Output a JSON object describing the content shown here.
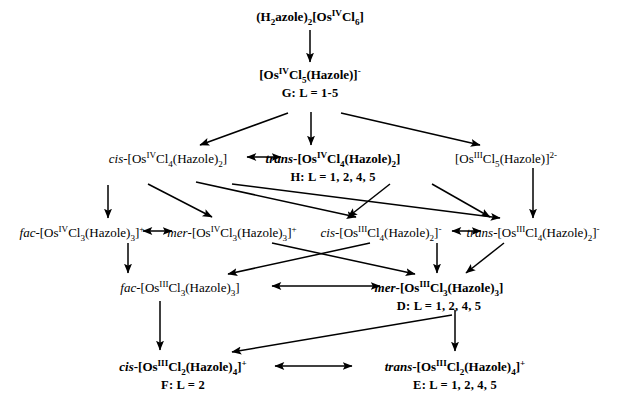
{
  "diagram": {
    "nodes": [
      {
        "id": "start",
        "formula_html": "(H<sub>2</sub>azole)<sub>2</sub>[Os<sup>IV</sup>Cl<sub>6</sub>]",
        "formula_text": "(H2azole)2[OsIVCl6]",
        "label": "",
        "x": 310,
        "y": 10,
        "bold": true
      },
      {
        "id": "G",
        "formula_html": "[Os<sup>IV</sup>Cl<sub>5</sub>(Hazole)]<sup>-</sup>",
        "formula_text": "[OsIVCl5(Hazole)]-",
        "label": "G: L = 1-5",
        "x": 310,
        "y": 68,
        "bold": true
      },
      {
        "id": "cis-Os4-Cl4",
        "formula_html": "<span class=\"ital-reg\">cis</span>-[Os<sup>IV</sup>Cl<sub>4</sub>(Hazole)<sub>2</sub>]",
        "formula_text": "cis-[OsIVCl4(Hazole)2]",
        "label": "",
        "x": 168,
        "y": 152,
        "bold": false
      },
      {
        "id": "trans-Os4-Cl4",
        "formula_html": "<span class=\"ital\">trans</span>-[Os<sup>IV</sup>Cl<sub>4</sub>(Hazole)<sub>2</sub>]",
        "formula_text": "trans-[OsIVCl4(Hazole)2]",
        "label": "H: L = 1, 2, 4, 5",
        "x": 333,
        "y": 152,
        "bold": true
      },
      {
        "id": "Os3-Cl5",
        "formula_html": "[Os<sup>III</sup>Cl<sub>5</sub>(Hazole)]<sup>2-</sup>",
        "formula_text": "[OsIIICl5(Hazole)]2-",
        "label": "",
        "x": 506,
        "y": 152,
        "bold": false
      },
      {
        "id": "fac-Os4-Cl3",
        "formula_html": "<span class=\"ital-reg\">fac</span>-[Os<sup>IV</sup>Cl<sub>3</sub>(Hazole)<sub>3</sub>]<sup>+</sup>",
        "formula_text": "fac-[OsIVCl3(Hazole)3]+",
        "label": "",
        "x": 82,
        "y": 226,
        "bold": false
      },
      {
        "id": "mer-Os4-Cl3",
        "formula_html": "<span class=\"ital-reg\">mer</span>-[Os<sup>IV</sup>Cl<sub>3</sub>(Hazole)<sub>3</sub>]<sup>+</sup>",
        "formula_text": "mer-[OsIVCl3(Hazole)3]+",
        "label": "",
        "x": 232,
        "y": 226,
        "bold": false
      },
      {
        "id": "cis-Os3-Cl4",
        "formula_html": "<span class=\"ital-reg\">cis</span>-[Os<sup>III</sup>Cl<sub>4</sub>(Hazole)<sub>2</sub>]<sup>-</sup>",
        "formula_text": "cis-[OsIIICl4(Hazole)2]-",
        "label": "",
        "x": 381,
        "y": 226,
        "bold": false
      },
      {
        "id": "trans-Os3-Cl4",
        "formula_html": "<span class=\"ital-reg\">trans</span>-[Os<sup>III</sup>Cl<sub>4</sub>(Hazole)<sub>2</sub>]<sup>-</sup>",
        "formula_text": "trans-[OsIIICl4(Hazole)2]-",
        "label": "",
        "x": 533,
        "y": 226,
        "bold": false
      },
      {
        "id": "fac-Os3-Cl3",
        "formula_html": "<span class=\"ital-reg\">fac</span>-[Os<sup>III</sup>Cl<sub>3</sub>(Hazole)<sub>3</sub>]",
        "formula_text": "fac-[OsIIICl3(Hazole)3]",
        "label": "",
        "x": 180,
        "y": 281,
        "bold": false
      },
      {
        "id": "D",
        "formula_html": "<span class=\"ital\">mer</span>-[Os<sup>III</sup>Cl<sub>3</sub>(Hazole)<sub>3</sub>]",
        "formula_text": "mer-[OsIIICl3(Hazole)3]",
        "label": "D: L = 1, 2, 4, 5",
        "x": 439,
        "y": 281,
        "bold": true
      },
      {
        "id": "F",
        "formula_html": "<span class=\"ital\">cis</span>-[Os<sup>III</sup>Cl<sub>2</sub>(Hazole)<sub>4</sub>]<sup>+</sup>",
        "formula_text": "cis-[OsIIICl2(Hazole)4]+",
        "label": "F: L = 2",
        "x": 183,
        "y": 360,
        "bold": true
      },
      {
        "id": "E",
        "formula_html": "<span class=\"ital\">trans</span>-[Os<sup>III</sup>Cl<sub>2</sub>(Hazole)<sub>4</sub>]<sup>+</sup>",
        "formula_text": "trans-[OsIIICl2(Hazole)4]+",
        "label": "E: L = 1, 2, 4, 5",
        "x": 455,
        "y": 360,
        "bold": true
      }
    ],
    "arrows": [
      {
        "name": "start-to-G",
        "from": "start",
        "to": "G",
        "kind": "single",
        "x1": 310,
        "y1": 30,
        "x2": 310,
        "y2": 62
      },
      {
        "name": "G-to-cis-Os4",
        "from": "G",
        "to": "cis-Os4-Cl4",
        "kind": "single",
        "x1": 288,
        "y1": 113,
        "x2": 200,
        "y2": 145
      },
      {
        "name": "G-to-trans-Os4",
        "from": "G",
        "to": "trans-Os4-Cl4",
        "kind": "single",
        "x1": 311,
        "y1": 112,
        "x2": 311,
        "y2": 145
      },
      {
        "name": "G-to-Os3Cl5",
        "from": "G",
        "to": "Os3-Cl5",
        "kind": "single",
        "x1": 341,
        "y1": 113,
        "x2": 480,
        "y2": 145
      },
      {
        "name": "cis-trans-Os4Cl4-equilibrium",
        "from": "cis-Os4-Cl4",
        "to": "trans-Os4-Cl4",
        "kind": "double",
        "x1": 247,
        "y1": 157,
        "x2": 281,
        "y2": 157
      },
      {
        "name": "cis-Os4Cl4-to-fac-Os4Cl3",
        "from": "cis-Os4-Cl4",
        "to": "fac-Os4-Cl3",
        "kind": "single",
        "x1": 108,
        "y1": 185,
        "x2": 108,
        "y2": 218
      },
      {
        "name": "cis-Os4Cl4-to-mer-Os4Cl3",
        "from": "cis-Os4-Cl4",
        "to": "mer-Os4-Cl3",
        "kind": "single",
        "x1": 148,
        "y1": 184,
        "x2": 212,
        "y2": 217
      },
      {
        "name": "cis-Os4Cl4-to-cis-Os3Cl4",
        "from": "cis-Os4-Cl4",
        "to": "cis-Os3-Cl4",
        "kind": "single",
        "x1": 196,
        "y1": 182,
        "x2": 356,
        "y2": 217
      },
      {
        "name": "cis-Os4Cl4-to-trans-Os3Cl4",
        "from": "cis-Os4-Cl4",
        "to": "trans-Os3-Cl4",
        "kind": "single",
        "x1": 232,
        "y1": 184,
        "x2": 500,
        "y2": 218
      },
      {
        "name": "trans-Os4Cl4-to-cis-Os3Cl4",
        "from": "trans-Os4-Cl4",
        "to": "cis-Os3-Cl4",
        "kind": "single",
        "x1": 390,
        "y1": 184,
        "x2": 348,
        "y2": 217
      },
      {
        "name": "trans-Os4Cl4-to-trans-Os3Cl4",
        "from": "trans-Os4-Cl4",
        "to": "trans-Os3-Cl4",
        "kind": "single",
        "x1": 432,
        "y1": 184,
        "x2": 490,
        "y2": 217
      },
      {
        "name": "Os3Cl5-to-trans-Os3Cl4",
        "from": "Os3-Cl5",
        "to": "trans-Os3-Cl4",
        "kind": "single",
        "x1": 533,
        "y1": 168,
        "x2": 533,
        "y2": 218
      },
      {
        "name": "fac-mer-Os4Cl3-equilibrium",
        "from": "fac-Os4-Cl3",
        "to": "mer-Os4-Cl3",
        "kind": "double",
        "x1": 143,
        "y1": 231,
        "x2": 172,
        "y2": 231
      },
      {
        "name": "cis-trans-Os3Cl4-equilibrium",
        "from": "cis-Os3-Cl4",
        "to": "trans-Os3-Cl4",
        "kind": "double",
        "x1": 452,
        "y1": 231,
        "x2": 481,
        "y2": 231
      },
      {
        "name": "fac-Os4Cl3-to-fac-Os3Cl3",
        "from": "fac-Os4-Cl3",
        "to": "fac-Os3-Cl3",
        "kind": "single",
        "x1": 128,
        "y1": 243,
        "x2": 128,
        "y2": 273
      },
      {
        "name": "mer-Os4Cl3-to-D",
        "from": "mer-Os4-Cl3",
        "to": "D",
        "kind": "single",
        "x1": 272,
        "y1": 243,
        "x2": 415,
        "y2": 274
      },
      {
        "name": "cis-Os3Cl4-to-fac-Os3Cl3",
        "from": "cis-Os3-Cl4",
        "to": "fac-Os3-Cl3",
        "kind": "single",
        "x1": 370,
        "y1": 243,
        "x2": 228,
        "y2": 274
      },
      {
        "name": "cis-Os3Cl4-to-D",
        "from": "cis-Os3-Cl4",
        "to": "D",
        "kind": "single",
        "x1": 437,
        "y1": 243,
        "x2": 437,
        "y2": 273
      },
      {
        "name": "trans-Os3Cl4-to-D",
        "from": "trans-Os3-Cl4",
        "to": "D",
        "kind": "single",
        "x1": 504,
        "y1": 243,
        "x2": 466,
        "y2": 273
      },
      {
        "name": "fac-D-equilibrium",
        "from": "fac-Os3-Cl3",
        "to": "D",
        "kind": "double",
        "x1": 272,
        "y1": 286,
        "x2": 380,
        "y2": 286
      },
      {
        "name": "fac-Os3Cl3-to-F",
        "from": "fac-Os3-Cl3",
        "to": "F",
        "kind": "single",
        "x1": 160,
        "y1": 301,
        "x2": 160,
        "y2": 350
      },
      {
        "name": "D-to-E",
        "from": "D",
        "to": "E",
        "kind": "single",
        "x1": 455,
        "y1": 310,
        "x2": 455,
        "y2": 351
      },
      {
        "name": "D-to-F",
        "from": "D",
        "to": "F",
        "kind": "single",
        "x1": 452,
        "y1": 315,
        "x2": 232,
        "y2": 352
      },
      {
        "name": "F-E-equilibrium",
        "from": "F",
        "to": "E",
        "kind": "double",
        "x1": 275,
        "y1": 366,
        "x2": 352,
        "y2": 366
      }
    ]
  }
}
